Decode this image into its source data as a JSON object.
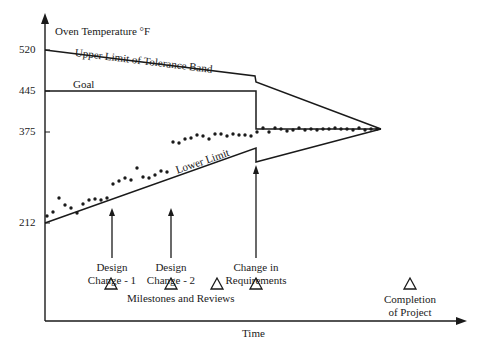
{
  "chart_data": {
    "type": "line",
    "title": "",
    "ylabel": "Oven Temperature °F",
    "xlabel": "Time",
    "y_ticks": [
      {
        "value": 520,
        "label": "520"
      },
      {
        "value": 445,
        "label": "445"
      },
      {
        "value": 375,
        "label": "375"
      },
      {
        "value": 212,
        "label": "212"
      }
    ],
    "series": [
      {
        "name": "Upper Limit of Tolerance Band",
        "style": "line",
        "points": [
          [
            0,
            520
          ],
          [
            0.63,
            475
          ],
          [
            0.63,
            466
          ],
          [
            1.0,
            375
          ]
        ]
      },
      {
        "name": "Goal",
        "style": "line",
        "points": [
          [
            0,
            445
          ],
          [
            0.63,
            445
          ],
          [
            0.63,
            375
          ],
          [
            1.0,
            375
          ]
        ]
      },
      {
        "name": "Lower Limit",
        "style": "line",
        "points": [
          [
            0,
            212
          ],
          [
            0.63,
            345
          ],
          [
            0.63,
            320
          ],
          [
            1.0,
            375
          ]
        ]
      },
      {
        "name": "Measured Temperature",
        "style": "scatter",
        "points_px": [
          [
            47,
            216
          ],
          [
            53,
            212
          ],
          [
            59,
            198
          ],
          [
            65,
            205
          ],
          [
            71,
            208
          ],
          [
            77,
            213
          ],
          [
            83,
            204
          ],
          [
            89,
            200
          ],
          [
            95,
            199
          ],
          [
            101,
            200
          ],
          [
            107,
            198
          ],
          [
            113,
            184
          ],
          [
            119,
            181
          ],
          [
            125,
            178
          ],
          [
            131,
            180
          ],
          [
            137,
            168
          ],
          [
            143,
            177
          ],
          [
            149,
            178
          ],
          [
            155,
            175
          ],
          [
            161,
            171
          ],
          [
            167,
            172
          ],
          [
            173,
            142
          ],
          [
            179,
            143
          ],
          [
            185,
            139
          ],
          [
            191,
            138
          ],
          [
            197,
            135
          ],
          [
            203,
            136
          ],
          [
            209,
            139
          ],
          [
            215,
            134
          ],
          [
            221,
            134
          ],
          [
            227,
            136
          ],
          [
            233,
            134
          ],
          [
            239,
            135
          ],
          [
            245,
            135
          ],
          [
            251,
            136
          ],
          [
            257,
            132
          ],
          [
            263,
            128
          ],
          [
            269,
            132
          ],
          [
            275,
            128
          ],
          [
            281,
            129
          ],
          [
            287,
            131
          ],
          [
            293,
            130
          ],
          [
            299,
            128
          ],
          [
            305,
            130
          ],
          [
            311,
            129
          ],
          [
            317,
            130
          ],
          [
            323,
            129
          ],
          [
            329,
            129
          ],
          [
            335,
            128
          ],
          [
            341,
            129
          ],
          [
            347,
            129
          ],
          [
            353,
            130
          ],
          [
            359,
            128
          ],
          [
            365,
            130
          ],
          [
            371,
            129
          ],
          [
            377,
            129
          ]
        ]
      }
    ],
    "annotations": [
      {
        "text": "Design Change - 1",
        "type": "arrow"
      },
      {
        "text": "Design Change - 2",
        "type": "arrow"
      },
      {
        "text": "Change in Requirements",
        "type": "arrow"
      },
      {
        "text": "Milestones and Reviews",
        "type": "triangle-markers",
        "count": 4
      },
      {
        "text": "Completion of Project",
        "type": "triangle-marker"
      }
    ],
    "grid": false,
    "legend": "none (inline labels)"
  },
  "labels": {
    "y_axis_title": "Oven Temperature °F",
    "x_axis_title": "Time",
    "upper_limit": "Upper Limit of Tolerance Band",
    "goal": "Goal",
    "lower_limit": "Lower Limit",
    "tick_520": "520",
    "tick_445": "445",
    "tick_375": "375",
    "tick_212": "212",
    "design_change_1_l1": "Design",
    "design_change_1_l2": "Change - 1",
    "design_change_2_l1": "Design",
    "design_change_2_l2": "Change - 2",
    "change_req_l1": "Change in",
    "change_req_l2": "Requirements",
    "milestones": "Milestones and Reviews",
    "completion_l1": "Completion",
    "completion_l2": "of Project"
  },
  "colors": {
    "ink": "#1a1a1a",
    "background": "#ffffff"
  }
}
